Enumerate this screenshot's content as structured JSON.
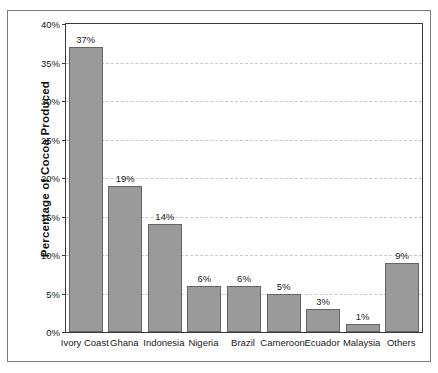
{
  "chart_data": {
    "type": "bar",
    "title": "",
    "xlabel": "",
    "ylabel": "Percentage of Cocoa Produced",
    "ylim": [
      0,
      40
    ],
    "yticks": [
      "0%",
      "5%",
      "10%",
      "15%",
      "20%",
      "25%",
      "30%",
      "35%",
      "40%"
    ],
    "ytick_values": [
      0,
      5,
      10,
      15,
      20,
      25,
      30,
      35,
      40
    ],
    "grid": true,
    "legend": "none",
    "categories": [
      "Ivory Coast",
      "Ghana",
      "Indonesia",
      "Nigeria",
      "Brazil",
      "Cameroon",
      "Ecuador",
      "Malaysia",
      "Others"
    ],
    "values": [
      37,
      19,
      14,
      6,
      6,
      5,
      3,
      1,
      9
    ],
    "data_labels": [
      "37%",
      "19%",
      "14%",
      "6%",
      "6%",
      "5%",
      "3%",
      "1%",
      "9%"
    ],
    "bar_color": "#9a9a9a",
    "bar_edge_color": "#646464",
    "gridline_color": "#c9c9c9",
    "axis_color": "#3a3a3a",
    "background_color": "#ffffff"
  }
}
